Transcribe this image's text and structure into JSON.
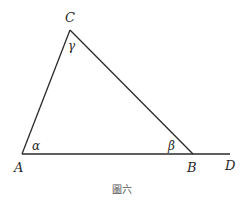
{
  "figure": {
    "caption": "圖六",
    "points": {
      "A": {
        "label": "A",
        "x": 22,
        "y": 154
      },
      "B": {
        "label": "B",
        "x": 193,
        "y": 154
      },
      "C": {
        "label": "C",
        "x": 70,
        "y": 30
      },
      "D": {
        "label": "D",
        "x": 230,
        "y": 154
      }
    },
    "angles": {
      "alpha": {
        "label": "α",
        "vertex": "A"
      },
      "beta": {
        "label": "β",
        "vertex": "B"
      },
      "gamma": {
        "label": "γ",
        "vertex": "C"
      }
    },
    "segments": [
      "AC",
      "CB",
      "AB",
      "BD"
    ],
    "line_color": "#2a2a2a"
  }
}
